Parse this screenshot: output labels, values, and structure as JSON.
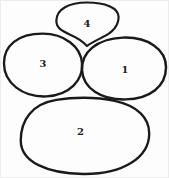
{
  "diagram": {
    "stroke_color": "#1a1a1a",
    "label_color": "#1a1a1a",
    "background_color": "#fdfdfd",
    "shapes": [
      {
        "name": "oval-1",
        "label": "1"
      },
      {
        "name": "oval-2",
        "label": "2"
      },
      {
        "name": "oval-3",
        "label": "3"
      },
      {
        "name": "oval-4",
        "label": "4"
      }
    ]
  }
}
